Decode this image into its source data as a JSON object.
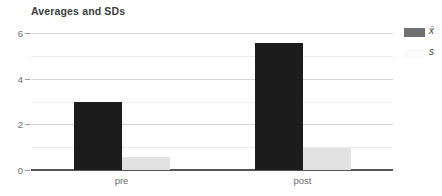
{
  "chart_data": {
    "type": "bar",
    "title": "Averages and SDs",
    "xlabel": "",
    "ylabel": "",
    "categories": [
      "pre",
      "post"
    ],
    "series": [
      {
        "name": "x̄",
        "color": "#1c1c1c",
        "values": [
          3.0,
          5.55
        ]
      },
      {
        "name": "s",
        "color": "#e2e2e2",
        "values": [
          0.55,
          0.95
        ]
      }
    ],
    "ylim": [
      0,
      6
    ],
    "y_ticks": [
      0,
      2,
      4,
      6
    ],
    "y_tick_labels": [
      "0",
      "2",
      "4",
      "6"
    ],
    "y_minor_ticks": [
      1,
      3,
      5
    ],
    "grid": true,
    "legend_position": "right"
  },
  "legend": {
    "entries": [
      {
        "label": "x̄",
        "swatch_color": "#707070"
      },
      {
        "label": "s",
        "swatch_color": "#fafafa"
      }
    ]
  },
  "axis": {
    "y_labels": [
      "6",
      "4",
      "2",
      "0"
    ],
    "x_labels": [
      "pre",
      "post"
    ]
  },
  "colors": {
    "mean_bar": "#1c1c1c",
    "sd_bar": "#e2e2e2",
    "gridline": "#d4d4d4",
    "gridline_minor": "#ececec",
    "axis_line": "#555555",
    "text": "#3d3d3d",
    "tick_text": "#6b6b6b",
    "background": "#ffffff"
  }
}
